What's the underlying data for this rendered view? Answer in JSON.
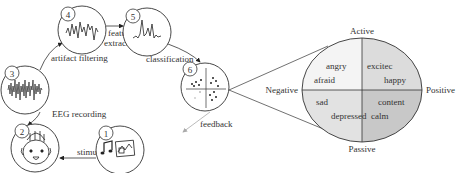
{
  "pipeline": {
    "steps": [
      {
        "number": "1",
        "name": "stimulus-presentation"
      },
      {
        "number": "2",
        "name": "subject"
      },
      {
        "number": "3",
        "name": "raw-eeg"
      },
      {
        "number": "4",
        "name": "filtered-eeg"
      },
      {
        "number": "5",
        "name": "features"
      },
      {
        "number": "6",
        "name": "classifier"
      }
    ],
    "edges": {
      "stimulus": "stimulus",
      "eeg_recording": "EEG recording",
      "artifact_filtering": "artifact filtering",
      "feature_extraction_1": "feature",
      "feature_extraction_2": "extraction",
      "classification": "classification",
      "feedback": "feedback"
    }
  },
  "emotion_model": {
    "axes": {
      "top": "Active",
      "bottom": "Passive",
      "left": "Negative",
      "right": "Positive"
    },
    "quadrants": {
      "top_left": [
        "angry",
        "afraid"
      ],
      "top_right": [
        "excitec",
        "happy"
      ],
      "bottom_left": [
        "sad",
        "depressed"
      ],
      "bottom_right": [
        "content",
        "calm"
      ]
    },
    "colors": {
      "top_left": "#f4f4f4",
      "top_right": "#dcdcdc",
      "bottom_left": "#e2e2e2",
      "bottom_right": "#c8c8c8"
    }
  }
}
